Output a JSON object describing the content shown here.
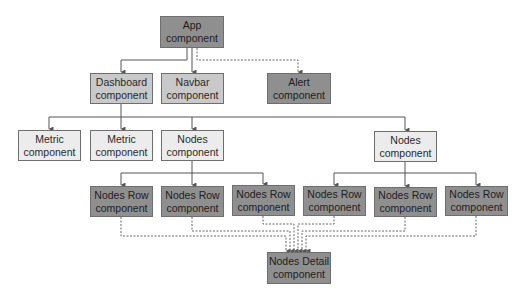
{
  "diagram": {
    "colors": {
      "dark": "#8f8f8f",
      "mid": "#c9c9c9",
      "light": "#ececec",
      "line": "#555555"
    },
    "nodes": {
      "app": {
        "label": "App\ncomponent"
      },
      "dashboard": {
        "label": "Dashboard\ncomponent"
      },
      "navbar": {
        "label": "Navbar\ncomponent"
      },
      "alert": {
        "label": "Alert\ncomponent"
      },
      "metric1": {
        "label": "Metric\ncomponent"
      },
      "metric2": {
        "label": "Metric\ncomponent"
      },
      "nodes1": {
        "label": "Nodes\ncomponent"
      },
      "nodes2": {
        "label": "Nodes\ncomponent"
      },
      "row1": {
        "label": "Nodes Row\ncomponent"
      },
      "row2": {
        "label": "Nodes Row\ncomponent"
      },
      "row3": {
        "label": "Nodes Row\ncomponent"
      },
      "row4": {
        "label": "Nodes Row\ncomponent"
      },
      "row5": {
        "label": "Nodes Row\ncomponent"
      },
      "row6": {
        "label": "Nodes Row\ncomponent"
      },
      "detail": {
        "label": "Nodes Detail\ncomponent"
      }
    },
    "edges": [
      {
        "from": "app",
        "to": "dashboard",
        "style": "solid"
      },
      {
        "from": "app",
        "to": "navbar",
        "style": "solid"
      },
      {
        "from": "app",
        "to": "alert",
        "style": "dashed"
      },
      {
        "from": "dashboard",
        "to": "metric1",
        "style": "solid"
      },
      {
        "from": "dashboard",
        "to": "metric2",
        "style": "solid"
      },
      {
        "from": "dashboard",
        "to": "nodes1",
        "style": "solid"
      },
      {
        "from": "dashboard",
        "to": "nodes2",
        "style": "solid"
      },
      {
        "from": "nodes1",
        "to": "row1",
        "style": "solid"
      },
      {
        "from": "nodes1",
        "to": "row2",
        "style": "solid"
      },
      {
        "from": "nodes1",
        "to": "row3",
        "style": "solid"
      },
      {
        "from": "nodes2",
        "to": "row4",
        "style": "solid"
      },
      {
        "from": "nodes2",
        "to": "row5",
        "style": "solid"
      },
      {
        "from": "nodes2",
        "to": "row6",
        "style": "solid"
      },
      {
        "from": "row1",
        "to": "detail",
        "style": "dashed"
      },
      {
        "from": "row2",
        "to": "detail",
        "style": "dashed"
      },
      {
        "from": "row3",
        "to": "detail",
        "style": "dashed"
      },
      {
        "from": "row4",
        "to": "detail",
        "style": "dashed"
      },
      {
        "from": "row5",
        "to": "detail",
        "style": "dashed"
      },
      {
        "from": "row6",
        "to": "detail",
        "style": "dashed"
      }
    ]
  }
}
